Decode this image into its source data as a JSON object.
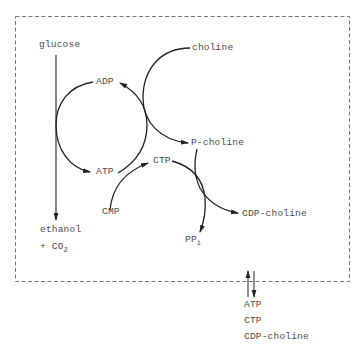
{
  "diagram": {
    "type": "metabolic-pathway",
    "compartment": {
      "style": "dashed-box"
    },
    "nodes": {
      "glucose": "glucose",
      "ethanol": "ethanol",
      "co2_prefix": "+ CO",
      "co2_sub": "2",
      "adp": "ADP",
      "atp": "ATP",
      "choline": "choline",
      "p_choline": "P-choline",
      "ctp": "CTP",
      "cmp": "CMP",
      "ppi_main": "PP",
      "ppi_sub": "i",
      "cdp_choline": "CDP-choline"
    },
    "exchange": {
      "symbol": "reversible-arrows",
      "items": [
        "ATP",
        "CTP",
        "CDP-choline"
      ]
    },
    "edges": [
      {
        "from": "glucose",
        "to": "ethanol + CO2"
      },
      {
        "from": "ADP",
        "to": "ATP",
        "coupled_with": "glucose -> ethanol"
      },
      {
        "from": "ATP",
        "to": "ADP",
        "coupled_with": "choline -> P-choline"
      },
      {
        "from": "choline",
        "to": "P-choline"
      },
      {
        "from": "ATP",
        "to": "CTP",
        "source": "CMP"
      },
      {
        "from": "CTP",
        "to": "PPi",
        "coupled_with": "P-choline -> CDP-choline"
      },
      {
        "from": "P-choline",
        "to": "CDP-choline"
      }
    ],
    "colors": {
      "line": "#222222",
      "text": "#4a4a4a",
      "dash": "#777777"
    }
  }
}
